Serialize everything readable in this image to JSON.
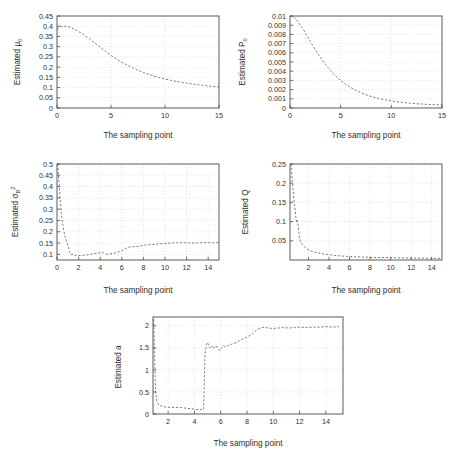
{
  "figure": {
    "background": "#ffffff",
    "curve_color": "#6d6d6d",
    "axis_color": "#4a4a4a",
    "grid_color": "#c8c8c8",
    "shared_xlabel": "The sampling point"
  },
  "chart_data": [
    {
      "type": "line",
      "id": "mu0",
      "title": "",
      "xlabel": "The sampling point",
      "ylabel": "Estimated μ0",
      "ylabel_main": "Estimated μ",
      "ylabel_sub": "0",
      "xlim": [
        0,
        15
      ],
      "ylim": [
        0,
        0.45
      ],
      "xticks": [
        0,
        5,
        10,
        15
      ],
      "xticklabels": [
        "0",
        "5",
        "10",
        "15"
      ],
      "yticks": [
        0,
        0.05,
        0.1,
        0.15,
        0.2,
        0.25,
        0.3,
        0.35,
        0.4,
        0.45
      ],
      "yticklabels": [
        "0",
        "0.05",
        "0.1",
        "0.15",
        "0.2",
        "0.25",
        "0.3",
        "0.35",
        "0.4",
        "0.45"
      ],
      "grid": true,
      "linestyle": "dashed",
      "x": [
        0,
        0.3,
        0.6,
        0.9,
        1.2,
        1.5,
        2,
        2.5,
        3,
        3.5,
        4,
        4.5,
        5,
        5.5,
        6,
        6.5,
        7,
        7.5,
        8,
        8.5,
        9,
        9.5,
        10,
        10.5,
        11,
        11.5,
        12,
        12.5,
        13,
        13.5,
        14,
        14.5,
        15
      ],
      "y": [
        0.385,
        0.397,
        0.4,
        0.399,
        0.395,
        0.389,
        0.374,
        0.357,
        0.338,
        0.318,
        0.297,
        0.277,
        0.257,
        0.24,
        0.224,
        0.21,
        0.197,
        0.185,
        0.174,
        0.165,
        0.156,
        0.149,
        0.142,
        0.136,
        0.131,
        0.126,
        0.122,
        0.118,
        0.114,
        0.111,
        0.108,
        0.105,
        0.103
      ]
    },
    {
      "type": "line",
      "id": "p0",
      "title": "",
      "xlabel": "The sampling point",
      "ylabel": "Estimated P0",
      "ylabel_main": "Estimated P",
      "ylabel_sub": "0",
      "xlim": [
        0,
        15
      ],
      "ylim": [
        0,
        0.01
      ],
      "xticks": [
        0,
        5,
        10,
        15
      ],
      "xticklabels": [
        "0",
        "5",
        "10",
        "15"
      ],
      "yticks": [
        0,
        0.001,
        0.002,
        0.003,
        0.004,
        0.005,
        0.006,
        0.007,
        0.008,
        0.009,
        0.01
      ],
      "yticklabels": [
        "0",
        "0.001",
        "0.002",
        "0.003",
        "0.004",
        "0.005",
        "0.006",
        "0.007",
        "0.008",
        "0.009",
        "0.01"
      ],
      "grid": true,
      "linestyle": "dashed",
      "x": [
        0,
        0.4,
        0.8,
        1.2,
        1.6,
        2,
        2.5,
        3,
        3.5,
        4,
        4.5,
        5,
        5.5,
        6,
        6.5,
        7,
        7.5,
        8,
        8.5,
        9,
        9.5,
        10,
        10.5,
        11,
        11.5,
        12,
        12.5,
        13,
        13.5,
        14,
        14.5,
        15
      ],
      "y": [
        0.01,
        0.00985,
        0.0094,
        0.00875,
        0.008,
        0.00725,
        0.00632,
        0.00548,
        0.00472,
        0.00406,
        0.00349,
        0.003,
        0.00258,
        0.00222,
        0.00192,
        0.00166,
        0.00144,
        0.00126,
        0.0011,
        0.00097,
        0.00086,
        0.00077,
        0.00069,
        0.00062,
        0.00056,
        0.00051,
        0.00047,
        0.00043,
        0.0004,
        0.00037,
        0.00035,
        0.00033
      ]
    },
    {
      "type": "line",
      "id": "sigma_b2",
      "title": "",
      "xlabel": "The sampling point",
      "ylabel": "Estimated σB²",
      "ylabel_main": "Estimated σ",
      "ylabel_sub": "B",
      "ylabel_sup": "2",
      "xlim": [
        0,
        15
      ],
      "ylim": [
        0.075,
        0.5
      ],
      "xticks": [
        0,
        2,
        4,
        6,
        8,
        10,
        12,
        14
      ],
      "xticklabels": [
        "0",
        "2",
        "4",
        "6",
        "8",
        "10",
        "12",
        "14"
      ],
      "yticks": [
        0.1,
        0.15,
        0.2,
        0.25,
        0.3,
        0.35,
        0.4,
        0.45,
        0.5
      ],
      "yticklabels": [
        "0.1",
        "0.15",
        "0.2",
        "0.25",
        "0.3",
        "0.35",
        "0.4",
        "0.45",
        "0.5"
      ],
      "grid": true,
      "linestyle": "dashed",
      "x": [
        0.05,
        0.12,
        0.2,
        0.28,
        0.36,
        0.45,
        0.55,
        0.65,
        0.75,
        0.85,
        0.95,
        1.05,
        1.15,
        1.3,
        1.5,
        1.7,
        1.9,
        2.2,
        2.5,
        2.8,
        3.1,
        3.4,
        3.7,
        4,
        4.3,
        4.6,
        4.9,
        5.2,
        5.5,
        5.8,
        6.1,
        6.4,
        6.7,
        7,
        7.4,
        7.8,
        8.2,
        8.6,
        9,
        9.5,
        10,
        10.5,
        11,
        11.5,
        12,
        12.5,
        13,
        13.5,
        14,
        14.5,
        15
      ],
      "y": [
        0.5,
        0.46,
        0.41,
        0.355,
        0.305,
        0.262,
        0.228,
        0.2,
        0.178,
        0.162,
        0.148,
        0.133,
        0.113,
        0.098,
        0.1,
        0.095,
        0.094,
        0.095,
        0.096,
        0.098,
        0.1,
        0.102,
        0.105,
        0.108,
        0.107,
        0.1,
        0.102,
        0.104,
        0.108,
        0.112,
        0.118,
        0.127,
        0.132,
        0.134,
        0.135,
        0.138,
        0.141,
        0.143,
        0.144,
        0.147,
        0.148,
        0.15,
        0.151,
        0.152,
        0.151,
        0.15,
        0.151,
        0.152,
        0.152,
        0.151,
        0.152
      ]
    },
    {
      "type": "line",
      "id": "q",
      "title": "",
      "xlabel": "The sampling point",
      "ylabel": "Estimated Q",
      "ylabel_main": "Estimated Q",
      "xlim": [
        0.2,
        15
      ],
      "ylim": [
        0,
        0.25
      ],
      "xticks": [
        2,
        4,
        6,
        8,
        10,
        12,
        14
      ],
      "xticklabels": [
        "2",
        "4",
        "6",
        "8",
        "10",
        "12",
        "14"
      ],
      "yticks": [
        0.05,
        0.1,
        0.15,
        0.2,
        0.25
      ],
      "yticklabels": [
        "0.05",
        "0.1",
        "0.15",
        "0.2",
        "0.25"
      ],
      "grid": true,
      "linestyle": "dashed",
      "x": [
        0.3,
        0.35,
        0.4,
        0.45,
        0.5,
        0.55,
        0.6,
        0.65,
        0.7,
        0.75,
        0.8,
        0.85,
        0.9,
        0.95,
        1,
        1.1,
        1.2,
        1.35,
        1.5,
        1.7,
        1.9,
        2.2,
        2.5,
        2.8,
        3.2,
        3.6,
        4,
        4.5,
        5,
        5.5,
        6,
        6.5,
        7,
        7.5,
        8,
        9,
        10,
        11,
        12,
        13,
        14,
        15
      ],
      "y": [
        0.25,
        0.235,
        0.21,
        0.198,
        0.185,
        0.166,
        0.152,
        0.142,
        0.13,
        0.118,
        0.104,
        0.098,
        0.103,
        0.098,
        0.085,
        0.065,
        0.05,
        0.042,
        0.038,
        0.032,
        0.028,
        0.024,
        0.021,
        0.019,
        0.017,
        0.015,
        0.014,
        0.012,
        0.011,
        0.01,
        0.009,
        0.0085,
        0.008,
        0.0075,
        0.007,
        0.0065,
        0.006,
        0.0055,
        0.005,
        0.0048,
        0.0045,
        0.0042
      ]
    },
    {
      "type": "line",
      "id": "a",
      "title": "",
      "xlabel": "The sampling point",
      "ylabel": "Estimated a",
      "ylabel_main": "Estimated a",
      "xlim": [
        0.85,
        15.3
      ],
      "ylim": [
        0,
        2.2
      ],
      "xticks": [
        2,
        4,
        6,
        8,
        10,
        12,
        14
      ],
      "xticklabels": [
        "2",
        "4",
        "6",
        "8",
        "10",
        "12",
        "14"
      ],
      "yticks": [
        0,
        0.5,
        1,
        1.5,
        2
      ],
      "yticklabels": [
        "0",
        "0.5",
        "1",
        "1.5",
        "2"
      ],
      "grid": true,
      "linestyle": "dashed",
      "x": [
        0.9,
        0.95,
        1,
        1.05,
        1.15,
        1.3,
        1.5,
        1.7,
        1.9,
        2.2,
        2.5,
        2.8,
        3.1,
        3.4,
        3.7,
        4,
        4.3,
        4.55,
        4.7,
        4.75,
        4.8,
        4.9,
        5,
        5.15,
        5.3,
        5.45,
        5.6,
        5.75,
        5.9,
        6.05,
        6.2,
        6.4,
        6.6,
        6.8,
        7,
        7.2,
        7.5,
        7.8,
        8.1,
        8.4,
        8.7,
        9,
        9.3,
        9.6,
        10,
        10.4,
        10.8,
        11.2,
        11.6,
        12,
        12.5,
        13,
        13.5,
        14,
        14.5,
        15
      ],
      "y": [
        2.15,
        1.6,
        1.05,
        0.5,
        0.27,
        0.2,
        0.18,
        0.16,
        0.16,
        0.15,
        0.15,
        0.15,
        0.14,
        0.13,
        0.12,
        0.11,
        0.1,
        0.1,
        0.1,
        0.7,
        1.35,
        1.58,
        1.62,
        1.5,
        1.55,
        1.48,
        1.55,
        1.52,
        1.44,
        1.5,
        1.55,
        1.52,
        1.56,
        1.58,
        1.6,
        1.62,
        1.68,
        1.72,
        1.76,
        1.82,
        1.9,
        1.95,
        1.97,
        1.95,
        1.94,
        1.95,
        1.96,
        1.95,
        1.96,
        1.97,
        1.96,
        1.97,
        1.97,
        1.98,
        1.97,
        1.98
      ]
    }
  ]
}
